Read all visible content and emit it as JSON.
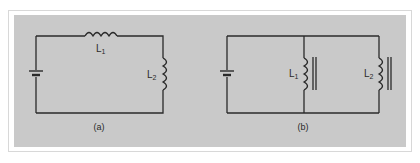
{
  "figure": {
    "background_color": "#c9c9c9",
    "wire_color": "#2a2a2a",
    "panels": [
      {
        "id": "a",
        "caption": "(a)",
        "description": "Series circuit: battery with two inductors in series",
        "components": [
          {
            "type": "battery",
            "label": ""
          },
          {
            "type": "inductor",
            "label": "L",
            "subscript": "1",
            "position": "top"
          },
          {
            "type": "inductor",
            "label": "L",
            "subscript": "2",
            "position": "right"
          }
        ]
      },
      {
        "id": "b",
        "caption": "(b)",
        "description": "Parallel circuit: battery with two iron-core inductors in parallel",
        "components": [
          {
            "type": "battery",
            "label": ""
          },
          {
            "type": "iron-core-inductor",
            "label": "L",
            "subscript": "1",
            "position": "middle"
          },
          {
            "type": "iron-core-inductor",
            "label": "L",
            "subscript": "2",
            "position": "right"
          }
        ]
      }
    ]
  }
}
